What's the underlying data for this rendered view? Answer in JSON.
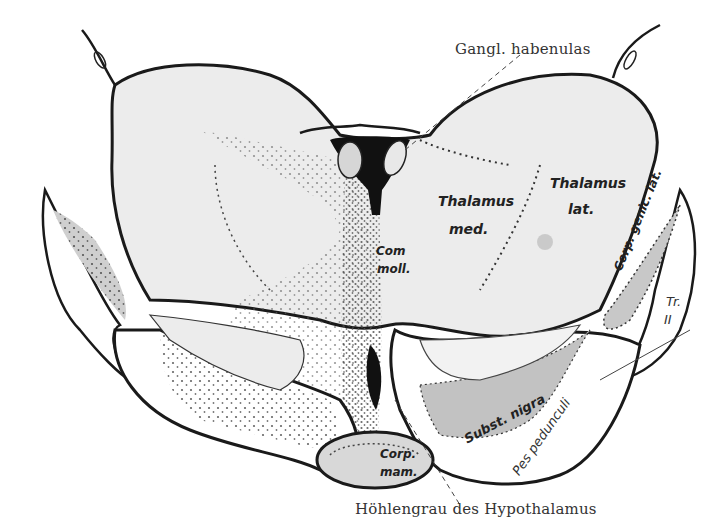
{
  "figure": {
    "labels": {
      "gangl_habenulae": "Gangl. habenulas",
      "thalamus_med_1": "Thalamus",
      "thalamus_med_2": "med.",
      "thalamus_lat_1": "Thalamus",
      "thalamus_lat_2": "lat.",
      "com_moll_1": "Com",
      "com_moll_2": "moll.",
      "corp_genic_lat": "Corp. genic. lat.",
      "tr_1": "Tr.",
      "tr_2": "II",
      "subst_nigra": "Subst. nigra",
      "pes_pedunculi": "Pes pedunculi",
      "corp_mam_1": "Corp.",
      "corp_mam_2": "mam.",
      "hoehlengrau": "Höhlengrau des Hypothalamus"
    },
    "colors": {
      "outline": "#1a1a1a",
      "gray_matter": "#e4e4e4",
      "dark_gray": "#c9c9c9",
      "ventricle": "#111111",
      "background": "#ffffff"
    }
  }
}
